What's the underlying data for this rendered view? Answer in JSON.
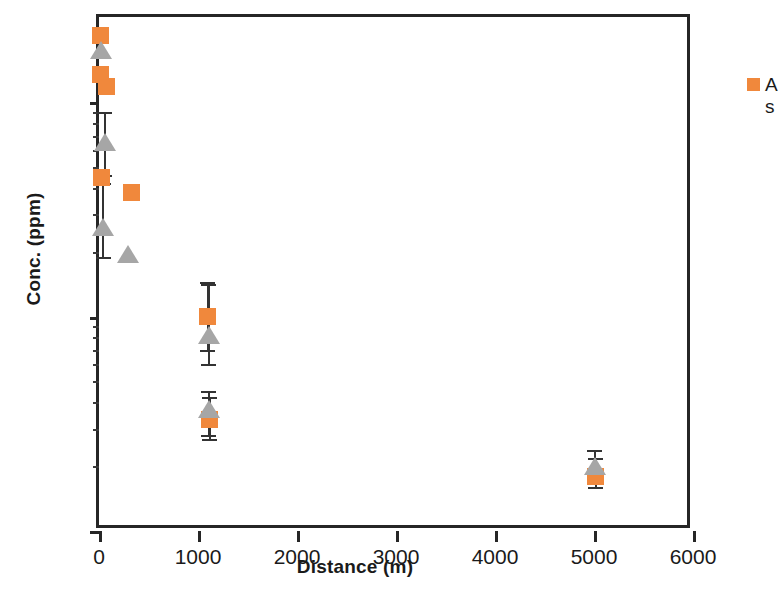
{
  "chart_data": {
    "type": "scatter",
    "title": "",
    "xlabel": "Distance (m)",
    "ylabel": "Conc. (ppm)",
    "xlim": [
      0,
      6000
    ],
    "ylim": [
      10,
      2500
    ],
    "yscale": "log",
    "xscale": "linear",
    "grid": false,
    "xticks": [
      "0",
      "1000",
      "2000",
      "3000",
      "4000",
      "5000",
      "6000"
    ],
    "yticks": [
      "10",
      "100",
      "1000"
    ],
    "legend": {
      "position": "top-right-inside",
      "entries": [
        {
          "label_line1": "A",
          "label_line2": "s",
          "full_label": "As",
          "marker": "square",
          "color": "#F0883C"
        }
      ]
    },
    "colors": {
      "series1": "#F0883C",
      "series2": "#A6A6A6",
      "axis": "#262626",
      "errorbar": "#333333"
    },
    "series": [
      {
        "name": "As",
        "marker": "square",
        "color": "#F0883C",
        "points": [
          {
            "x": 20,
            "y": 2050
          },
          {
            "x": 20,
            "y": 1350
          },
          {
            "x": 80,
            "y": 1180
          },
          {
            "x": 30,
            "y": 445
          },
          {
            "x": 330,
            "y": 380
          },
          {
            "x": 1100,
            "y": 100,
            "yerr_low": 70,
            "yerr_high": 145
          },
          {
            "x": 1120,
            "y": 33,
            "yerr_low": 27,
            "yerr_high": 42
          },
          {
            "x": 5020,
            "y": 18,
            "yerr_low": 16,
            "yerr_high": 22
          }
        ]
      },
      {
        "name": "series-2",
        "marker": "triangle",
        "color": "#A6A6A6",
        "points": [
          {
            "x": 25,
            "y": 1750
          },
          {
            "x": 60,
            "y": 650,
            "yerr_low": 460,
            "yerr_high": 900
          },
          {
            "x": 45,
            "y": 262,
            "yerr_low": 190,
            "yerr_high": 420
          },
          {
            "x": 290,
            "y": 195
          },
          {
            "x": 1110,
            "y": 82,
            "yerr_low": 60,
            "yerr_high": 142
          },
          {
            "x": 1110,
            "y": 37,
            "yerr_low": 28,
            "yerr_high": 45
          },
          {
            "x": 5010,
            "y": 20,
            "yerr_low": 17,
            "yerr_high": 24
          }
        ]
      }
    ]
  }
}
